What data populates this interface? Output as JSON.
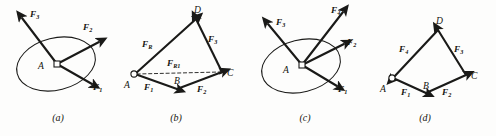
{
  "figure": {
    "background": "#fdfdfc",
    "ink": "#1a1a18",
    "panels": [
      {
        "id": "a",
        "caption": "(a)",
        "caption_x": 58,
        "type": "concurrent-force-system",
        "origin_label": "A",
        "has_ellipse": true,
        "has_resultant": false,
        "forces": [
          {
            "name": "F",
            "sub": "1",
            "label": "F1"
          },
          {
            "name": "F",
            "sub": "2",
            "label": "F2"
          },
          {
            "name": "F",
            "sub": "3",
            "label": "F3"
          }
        ]
      },
      {
        "id": "b",
        "caption": "(b)",
        "caption_x": 176,
        "type": "force-polygon",
        "vertices": [
          "A",
          "B",
          "C",
          "D"
        ],
        "has_ellipse": false,
        "has_resultant": true,
        "forces": [
          {
            "name": "F",
            "sub": "1",
            "label": "F1",
            "edge": "A-B"
          },
          {
            "name": "F",
            "sub": "2",
            "label": "F2",
            "edge": "B-C"
          },
          {
            "name": "F",
            "sub": "3",
            "label": "F3",
            "edge": "C-D"
          }
        ],
        "resultants": [
          {
            "name": "F",
            "sub": "R1",
            "label": "FR1",
            "edge": "A-C",
            "style": "dashed"
          },
          {
            "name": "F",
            "sub": "R",
            "label": "FR",
            "edge": "A-D",
            "style": "solid"
          }
        ]
      },
      {
        "id": "c",
        "caption": "(c)",
        "caption_x": 305,
        "type": "concurrent-force-system",
        "origin_label": "A",
        "has_ellipse": true,
        "has_resultant": false,
        "forces": [
          {
            "name": "F",
            "sub": "1",
            "label": "F1"
          },
          {
            "name": "F",
            "sub": "2",
            "label": "F2"
          },
          {
            "name": "F",
            "sub": "3",
            "label": "F3"
          },
          {
            "name": "F",
            "sub": "4",
            "label": "F4"
          }
        ]
      },
      {
        "id": "d",
        "caption": "(d)",
        "caption_x": 425,
        "type": "closed-force-polygon",
        "vertices": [
          "A",
          "B",
          "C",
          "D"
        ],
        "has_ellipse": false,
        "has_resultant": false,
        "forces": [
          {
            "name": "F",
            "sub": "1",
            "label": "F1",
            "edge": "A-B"
          },
          {
            "name": "F",
            "sub": "2",
            "label": "F2",
            "edge": "B-C"
          },
          {
            "name": "F",
            "sub": "3",
            "label": "F3",
            "edge": "C-D"
          },
          {
            "name": "F",
            "sub": "4",
            "label": "F4",
            "edge": "D-A"
          }
        ]
      }
    ]
  },
  "labels": {
    "F": "F",
    "sub1": "1",
    "sub2": "2",
    "sub3": "3",
    "sub4": "4",
    "subR": "R",
    "subR1": "R1",
    "A": "A",
    "B": "B",
    "C": "C",
    "D": "D",
    "capA": "(a)",
    "capB": "(b)",
    "capC": "(c)",
    "capD": "(d)"
  }
}
